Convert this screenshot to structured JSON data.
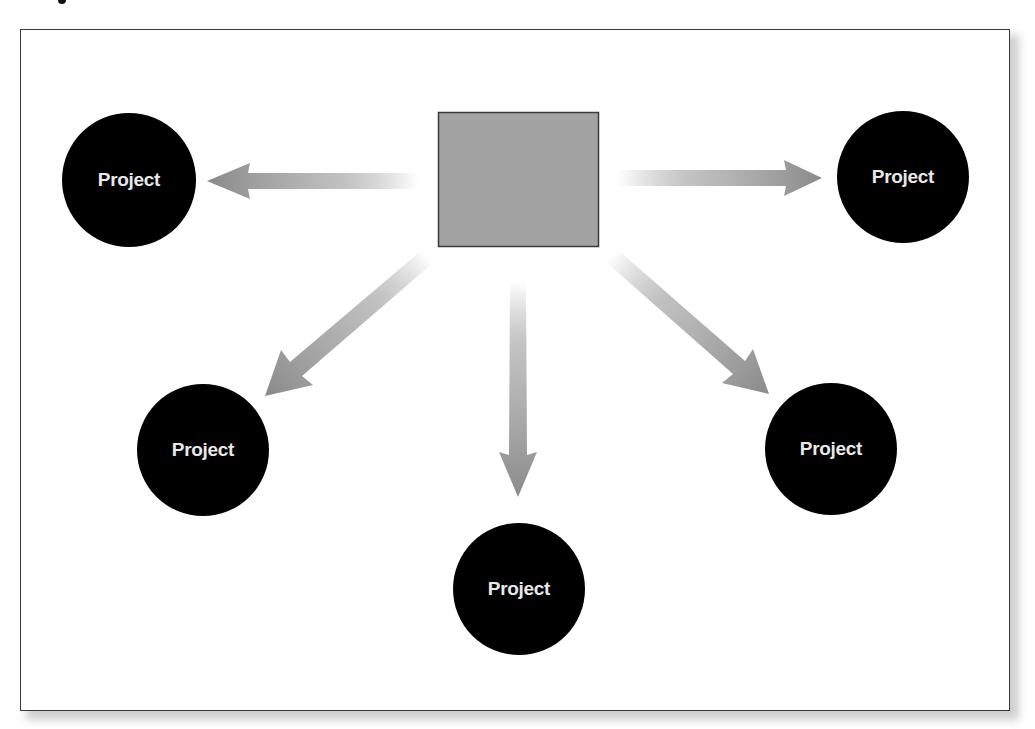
{
  "diagram": {
    "type": "hub-and-spoke",
    "hub": {
      "label": "",
      "shape": "square",
      "fill": "#a3a3a3",
      "stroke": "#3a3a3a"
    },
    "nodes": [
      {
        "id": "top-left",
        "label": "Project"
      },
      {
        "id": "top-right",
        "label": "Project"
      },
      {
        "id": "bottom-left",
        "label": "Project"
      },
      {
        "id": "bottom-center",
        "label": "Project"
      },
      {
        "id": "bottom-right",
        "label": "Project"
      }
    ],
    "edges": [
      {
        "from": "hub",
        "to": "top-left",
        "direction": "outward"
      },
      {
        "from": "hub",
        "to": "top-right",
        "direction": "outward"
      },
      {
        "from": "hub",
        "to": "bottom-left",
        "direction": "outward"
      },
      {
        "from": "hub",
        "to": "bottom-center",
        "direction": "outward"
      },
      {
        "from": "hub",
        "to": "bottom-right",
        "direction": "outward"
      }
    ],
    "colors": {
      "node_fill": "#000000",
      "node_text": "#e8e8e8",
      "arrow": "#8c8c8c",
      "frame_border": "#3a3a3a"
    }
  }
}
